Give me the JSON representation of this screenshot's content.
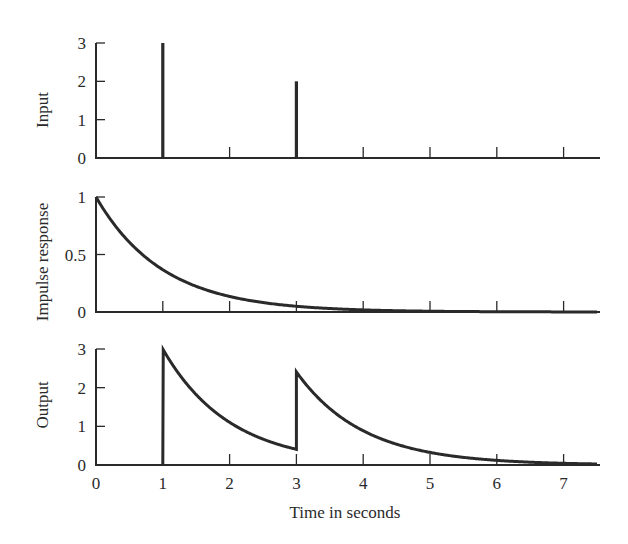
{
  "figure": {
    "xlabel": "Time in seconds",
    "x_ticks": [
      "0",
      "1",
      "2",
      "3",
      "4",
      "5",
      "6",
      "7"
    ],
    "ink_color": "#2a2a2a",
    "background": "#ffffff"
  },
  "chart_data": [
    {
      "type": "line",
      "title": "",
      "ylabel": "Input",
      "xlabel": "",
      "xlim": [
        0,
        7.5
      ],
      "ylim": [
        0,
        3
      ],
      "y_ticks": [
        "0",
        "1",
        "2",
        "3"
      ],
      "description": "Impulse train input",
      "impulses": [
        {
          "t": 1,
          "amplitude": 3
        },
        {
          "t": 3,
          "amplitude": 2
        }
      ]
    },
    {
      "type": "line",
      "title": "",
      "ylabel": "Impulse response",
      "xlabel": "",
      "xlim": [
        0,
        7.5
      ],
      "ylim": [
        0,
        1
      ],
      "y_ticks": [
        "0",
        "0.5",
        "1"
      ],
      "formula": "h(t) = exp(-t)",
      "x": [
        0,
        0.5,
        1,
        1.5,
        2,
        2.5,
        3,
        3.5,
        4,
        4.5,
        5,
        5.5,
        6,
        6.5,
        7,
        7.5
      ],
      "values": [
        1.0,
        0.61,
        0.37,
        0.22,
        0.14,
        0.08,
        0.05,
        0.03,
        0.02,
        0.01,
        0.01,
        0.0,
        0.0,
        0.0,
        0.0,
        0.0
      ]
    },
    {
      "type": "line",
      "title": "",
      "ylabel": "Output",
      "xlabel": "Time in seconds",
      "xlim": [
        0,
        7.5
      ],
      "ylim": [
        0,
        3
      ],
      "y_ticks": [
        "0",
        "1",
        "2",
        "3"
      ],
      "formula": "y(t) = 3·exp(-(t-1))·u(t-1) + 2·exp(-(t-3))·u(t-3)",
      "x": [
        0,
        1,
        1,
        1.5,
        2,
        2.5,
        3,
        3,
        3.5,
        4,
        4.5,
        5,
        5.5,
        6,
        6.5,
        7,
        7.5
      ],
      "values": [
        0,
        0,
        3.0,
        1.82,
        1.1,
        0.67,
        0.41,
        2.41,
        1.46,
        0.89,
        0.54,
        0.33,
        0.2,
        0.12,
        0.07,
        0.04,
        0.03
      ]
    }
  ]
}
